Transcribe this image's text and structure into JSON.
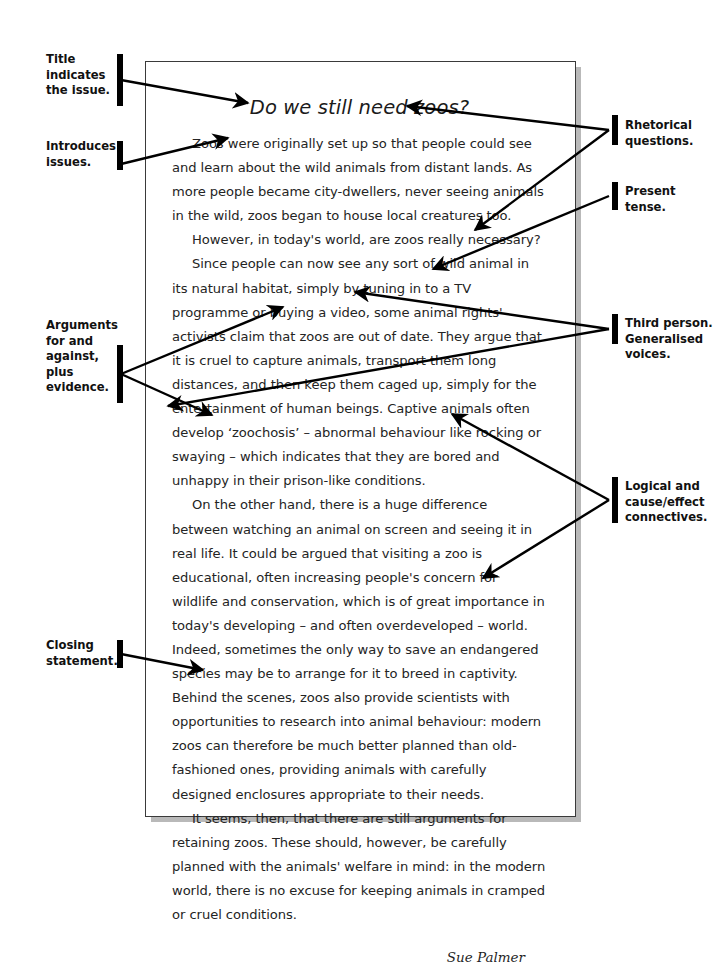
{
  "document": {
    "title": "Do we still need zoos?",
    "paragraphs": [
      "Zoos were originally set up so that people could see and learn about the wild animals from distant lands. As more people became city-dwellers, never seeing animals in the wild, zoos began to house local creatures too.",
      "However, in today's world, are zoos really necessary?",
      "Since people can now see any sort of wild animal in its natural habitat, simply by tuning in to a TV programme or buying a video, some animal rights' activists claim that zoos are out of date. They argue that it is cruel to capture animals, transport them long distances, and then keep them caged up, simply for the entertainment of human beings. Captive animals often develop ‘zoochosis’ – abnormal behaviour like rocking or swaying – which indicates that they are bored and unhappy in their prison-like conditions.",
      "On the other hand, there is a huge difference between watching an animal on screen and seeing it in real life. It could be argued that visiting a zoo is educational, often increasing people's concern for wildlife and conservation, which is of great importance in today's developing – and often overdeveloped – world. Indeed, sometimes the only way to save an endangered species may be to arrange for it to breed in captivity. Behind the scenes, zoos also provide scientists with opportunities to research into animal behaviour: modern zoos can therefore be much better planned than old-fashioned ones, providing animals with carefully designed enclosures appropriate to their needs.",
      "It seems, then, that there are still arguments for retaining zoos. These should, however, be carefully planned with the animals' welfare in mind: in the modern world, there is no excuse for keeping animals in cramped or cruel conditions."
    ],
    "signature": "Sue Palmer"
  },
  "annotations": {
    "left": [
      {
        "id": "title-indicates-issue",
        "text": "Title\nindicates\nthe issue."
      },
      {
        "id": "introduces-issues",
        "text": "Introduces\nissues."
      },
      {
        "id": "arguments-for-against",
        "text": "Arguments\nfor and\nagainst, plus\nevidence."
      },
      {
        "id": "closing-statement",
        "text": "Closing\nstatement."
      }
    ],
    "right": [
      {
        "id": "rhetorical-questions",
        "text": "Rhetorical\nquestions."
      },
      {
        "id": "present-tense",
        "text": "Present\ntense."
      },
      {
        "id": "third-person-generalised-voices",
        "text": "Third person.\nGeneralised\nvoices."
      },
      {
        "id": "logical-cause-effect-connectives",
        "text": "Logical and\ncause/effect\nconnectives."
      }
    ]
  },
  "colors": {
    "page_background": "#ffffff",
    "page_border": "#3a3a3a",
    "page_shadow": "#b9b9b9",
    "body_text": "#242424",
    "annotation_text": "#111111",
    "leader_line": "#000000"
  }
}
